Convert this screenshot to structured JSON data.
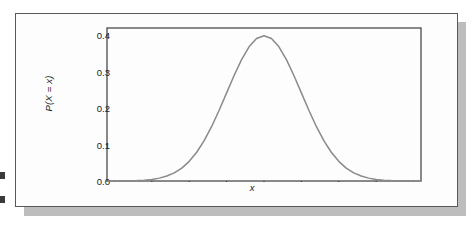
{
  "figure": {
    "kind": "textbook-figure-card",
    "background_color": "#fdfdfd",
    "border_color": "#585858",
    "shadow_color": "#bdbdbd",
    "page_background": "#ffffff"
  },
  "artifacts": {
    "margin_mark_label": "page-edge-mark",
    "margin_mark_color": "#3a3a3a"
  },
  "chart_data": {
    "type": "line",
    "title": "",
    "subtitle": "",
    "xlabel": "x",
    "ylabel": "P(X = x)",
    "curve_description": "normal (Gaussian) probability distribution curve",
    "line_color": "#8a8a8a",
    "axis_color": "#2b2b2b",
    "grid": false,
    "legend": null,
    "legend_position": "none",
    "xlim": [
      -4.2,
      4.2
    ],
    "ylim": [
      0.0,
      0.42
    ],
    "x_tick_labels": [
      "",
      "",
      "",
      "",
      "",
      "",
      "",
      "",
      ""
    ],
    "x_tick_values": [
      -4,
      -3,
      -2,
      -1,
      0,
      1,
      2,
      3,
      4
    ],
    "y_tick_labels": [
      "0.0",
      "0.1",
      "0.2",
      "0.3",
      "0.4"
    ],
    "y_tick_values": [
      0.0,
      0.1,
      0.2,
      0.3,
      0.4
    ],
    "mean": 0,
    "sigma": 1,
    "peak_value": 0.399,
    "x": [
      -4.2,
      -4.0,
      -3.8,
      -3.6,
      -3.4,
      -3.2,
      -3.0,
      -2.8,
      -2.6,
      -2.4,
      -2.2,
      -2.0,
      -1.8,
      -1.6,
      -1.4,
      -1.2,
      -1.0,
      -0.8,
      -0.6,
      -0.4,
      -0.2,
      0.0,
      0.2,
      0.4,
      0.6,
      0.8,
      1.0,
      1.2,
      1.4,
      1.6,
      1.8,
      2.0,
      2.2,
      2.4,
      2.6,
      2.8,
      3.0,
      3.2,
      3.4,
      3.6,
      3.8,
      4.0,
      4.2
    ],
    "y": [
      0.0001,
      0.0001,
      0.0003,
      0.0006,
      0.0012,
      0.0024,
      0.0044,
      0.0079,
      0.0136,
      0.0224,
      0.0355,
      0.054,
      0.079,
      0.1109,
      0.1497,
      0.1942,
      0.242,
      0.2897,
      0.3332,
      0.3683,
      0.391,
      0.3989,
      0.391,
      0.3683,
      0.3332,
      0.2897,
      0.242,
      0.1942,
      0.1497,
      0.1109,
      0.079,
      0.054,
      0.0355,
      0.0224,
      0.0136,
      0.0079,
      0.0044,
      0.0024,
      0.0012,
      0.0006,
      0.0003,
      0.0001,
      0.0001
    ]
  }
}
